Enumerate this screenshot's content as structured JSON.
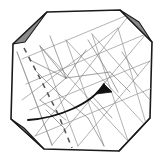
{
  "figure": {
    "type": "origami-diagram",
    "canvas": {
      "width": 163,
      "height": 162
    },
    "colors": {
      "paper_fill": "#ffffff",
      "paper_outline": "#1a1a1a",
      "corner_flap_fill": "#8a8a8a",
      "corner_flap_outline": "#1a1a1a",
      "crease_line": "#9a9a9a",
      "crease_line_strong": "#6f6f6f",
      "dashed_fold_line": "#555555",
      "arrow": "#111111",
      "background": "#ffffff"
    },
    "stroke_widths": {
      "paper_outline": 1.6,
      "corner_flap_outline": 1.2,
      "crease_line": 0.7,
      "dashed_fold_line": 1.5,
      "arrow": 1.8
    }
  },
  "paper": {
    "name": "octagonal-sheet",
    "outline_points": "47,12 120,10 152,42 150,118 119,151 44,149 11,119 13,44",
    "corner_count": 4
  },
  "corner_flaps": [
    {
      "id": "flap-top-left",
      "label": "top-left folded corner",
      "points": "13,44 47,12 25,42",
      "fill": "#8a8a8a"
    },
    {
      "id": "flap-top-right",
      "label": "top-right folded corner",
      "points": "120,10 152,42 139,22",
      "fill": "#8a8a8a"
    },
    {
      "id": "flap-bottom-left",
      "label": "bottom-left folded corner",
      "points": "11,119 44,149 24,128",
      "fill": "#8a8a8a"
    },
    {
      "id": "flap-bottom-right",
      "label": "bottom-right folded corner",
      "points": "150,118 119,151 139,130",
      "fill": "#8a8a8a"
    }
  ],
  "crease_grid": {
    "description": "Rotated square grid of mountain/valley creases plus diagonals forming X patterns",
    "primary_lines": [
      "22,59 130,14",
      "26,84 146,34",
      "30,110 150,61",
      "35,136 152,88",
      "52,145 17,52",
      "78,146 40,46",
      "104,146 66,40",
      "128,141 92,34",
      "147,127 118,28"
    ],
    "diagonal_lines": [
      "17,52 52,145",
      "40,46 128,141",
      "66,40 147,127",
      "92,34 150,100",
      "130,14 35,136",
      "146,34 52,145",
      "150,61 78,146",
      "118,28 22,100"
    ],
    "detail_lines": [
      "40,46 66,78",
      "66,78 40,100",
      "40,100 66,120",
      "30,60 66,78",
      "66,78 110,72",
      "50,36 66,78",
      "66,78 86,50",
      "35,70 60,95",
      "60,95 88,118",
      "88,118 104,146",
      "88,40 104,66",
      "104,66 118,92",
      "92,96 112,118",
      "46,110 64,128",
      "110,72 130,92",
      "122,52 138,76"
    ]
  },
  "fold_line": {
    "id": "valley-fold-dashed",
    "label": "dashed valley fold line",
    "path": "M 24,48 L 44,86 L 58,114 L 72,148",
    "dash_pattern": "5 5"
  },
  "action_arrow": {
    "id": "fold-direction-arrow",
    "label": "curved fold-direction arrow",
    "path": "M 28,120 C 58,118 92,104 104,84",
    "head_points": "104,84 96,94 112,92"
  }
}
